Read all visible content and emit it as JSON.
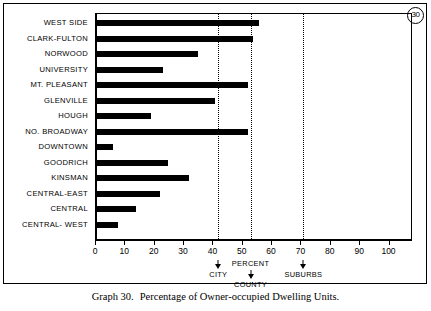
{
  "badge": {
    "number": "30"
  },
  "caption": {
    "label": "Graph 30.",
    "text": "Percentage of Owner-occupied Dwelling Units."
  },
  "chart_data": {
    "type": "bar",
    "orientation": "horizontal",
    "title": "Percentage of Owner-occupied Dwelling Units.",
    "xlabel": "PERCENT",
    "ylabel": "",
    "xlim": [
      0,
      100
    ],
    "grid": false,
    "legend": "none",
    "xticks": [
      0,
      10,
      20,
      30,
      40,
      50,
      60,
      70,
      80,
      90,
      100
    ],
    "xticklabels": [
      "0",
      "10",
      "20",
      "30",
      "40",
      "50",
      "60",
      "70",
      "80",
      "90",
      "100"
    ],
    "categories": [
      "WEST SIDE",
      "CLARK-FULTON",
      "NORWOOD",
      "UNIVERSITY",
      "MT. PLEASANT",
      "GLENVILLE",
      "HOUGH",
      "NO. BROADWAY",
      "DOWNTOWN",
      "GOODRICH",
      "KINSMAN",
      "CENTRAL-EAST",
      "CENTRAL",
      "CENTRAL- WEST"
    ],
    "values": [
      56,
      54,
      35,
      23,
      52,
      41,
      19,
      52,
      6,
      25,
      32,
      22,
      14,
      8
    ],
    "reference_lines": [
      {
        "label": "CITY",
        "value": 42
      },
      {
        "label": "COUNTY",
        "value": 53
      },
      {
        "label": "SUBURBS",
        "value": 71
      }
    ],
    "axis_annotations": [
      {
        "label": "CITY",
        "value": 42
      },
      {
        "label": "PERCENT",
        "value": 53
      },
      {
        "label": "COUNTY",
        "value": 53
      },
      {
        "label": "SUBURBS",
        "value": 71
      }
    ]
  }
}
